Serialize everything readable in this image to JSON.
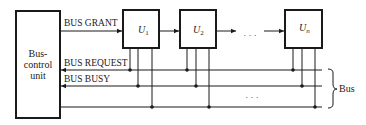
{
  "diagram": {
    "controller": {
      "line1": "Bus-",
      "line2": "control",
      "line3": "unit"
    },
    "signals": {
      "grant": "BUS GRANT",
      "request": "BUS REQUEST",
      "busy": "BUS BUSY"
    },
    "units": [
      {
        "name": "U",
        "sub": "1"
      },
      {
        "name": "U",
        "sub": "2"
      },
      {
        "name": "U",
        "sub": "n"
      }
    ],
    "ellipsis_top": "· · ·",
    "ellipsis_bus": "· · ·",
    "bus_label": "Bus",
    "colors": {
      "stroke": "#1a1a1a",
      "background": "#ffffff"
    }
  }
}
